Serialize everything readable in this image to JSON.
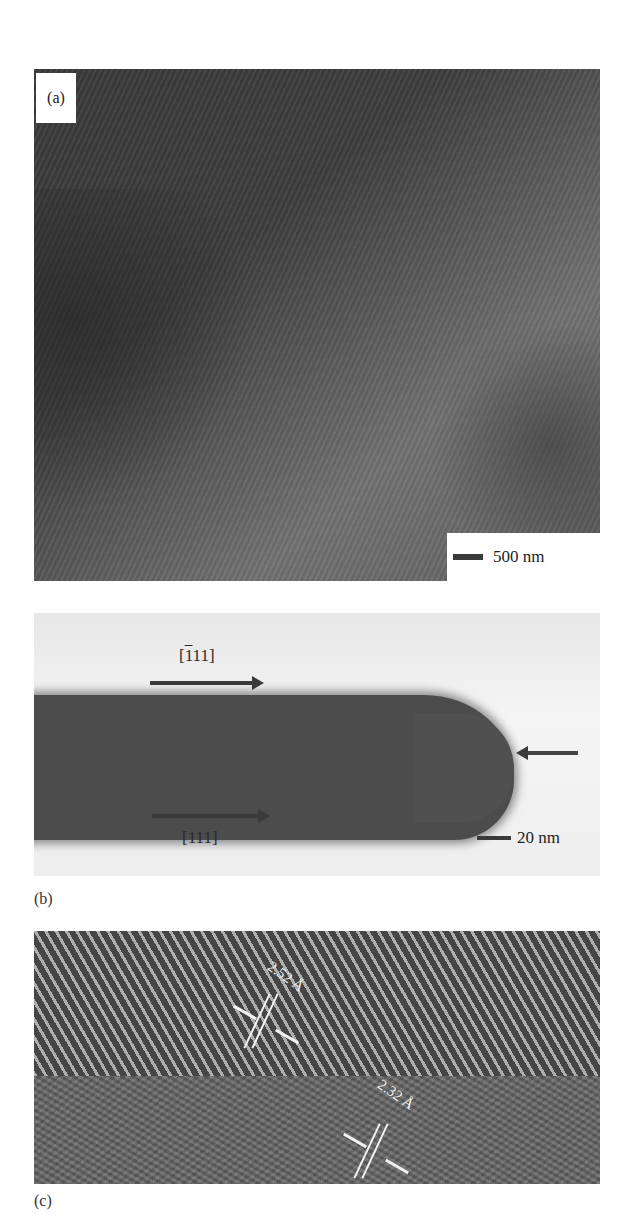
{
  "figure": {
    "panels": [
      {
        "id": "a",
        "label": "(a)",
        "scale_bar": "500 nm"
      },
      {
        "id": "b",
        "caption": "(b)",
        "direction_top": "[111]",
        "direction_top_bar": "1",
        "direction_top_rest": "11]",
        "direction_top_open": "[",
        "direction_bottom": "[111]",
        "scale_bar": "20 nm"
      },
      {
        "id": "c",
        "caption": "(c)",
        "spacing_1": "2.52 Å",
        "spacing_2": "2.32 Å"
      }
    ]
  }
}
